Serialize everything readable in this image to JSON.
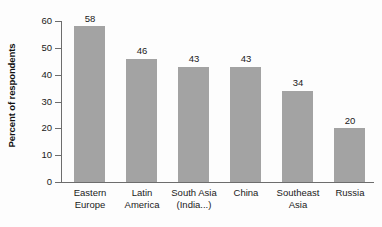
{
  "chart_data": {
    "type": "bar",
    "title": "",
    "subtitle": "",
    "xlabel": "",
    "ylabel": "Percent of respondents",
    "ylim": [
      0,
      60
    ],
    "ytick_labels": [
      "0",
      "10",
      "20",
      "30",
      "40",
      "50",
      "60"
    ],
    "ytick_values": [
      0,
      10,
      20,
      30,
      40,
      50,
      60
    ],
    "grid": false,
    "legend": null,
    "bar_color": "#a3a3a3",
    "axis_color": "#6d6d6d",
    "background_color": "#fdfdfd",
    "categories": [
      "Eastern Europe",
      "Latin America",
      "South Asia (India...)",
      "China",
      "Southeast Asia",
      "Russia"
    ],
    "category_lines": [
      [
        "Eastern",
        "Europe"
      ],
      [
        "Latin",
        "America"
      ],
      [
        "South Asia",
        "(India...)"
      ],
      [
        "China"
      ],
      [
        "Southeast",
        "Asia"
      ],
      [
        "Russia"
      ]
    ],
    "values": [
      58,
      46,
      43,
      43,
      34,
      20
    ],
    "value_labels": [
      "58",
      "46",
      "43",
      "43",
      "34",
      "20"
    ]
  }
}
